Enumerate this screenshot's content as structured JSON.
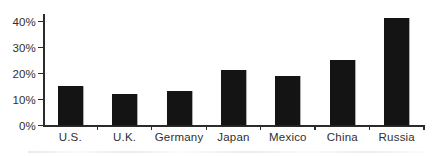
{
  "chart_data": {
    "type": "bar",
    "title": "",
    "xlabel": "",
    "ylabel": "",
    "categories": [
      "U.S.",
      "U.K.",
      "Germany",
      "Japan",
      "Mexico",
      "China",
      "Russia"
    ],
    "values": [
      15,
      12,
      13,
      21,
      19,
      25,
      41
    ],
    "ylim": [
      0,
      40
    ],
    "yticks": [
      0,
      10,
      20,
      30,
      40
    ],
    "ytick_labels": [
      "0%",
      "10%",
      "20%",
      "30%",
      "40%"
    ],
    "grid": false,
    "legend": null,
    "bar_color": "#141414",
    "axis_color": "#2b2b2b",
    "label_color": "#302f2e"
  }
}
